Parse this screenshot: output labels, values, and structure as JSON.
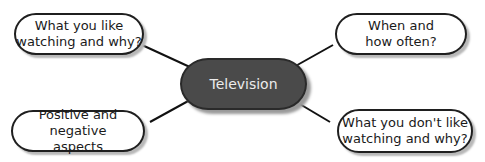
{
  "center": {
    "label": "Television"
  },
  "nodes": [
    {
      "label": "What you like watching and why?"
    },
    {
      "label": "When and how often?"
    },
    {
      "label": "Positive and negative aspects"
    },
    {
      "label": "What you don't like watching and why?"
    }
  ]
}
